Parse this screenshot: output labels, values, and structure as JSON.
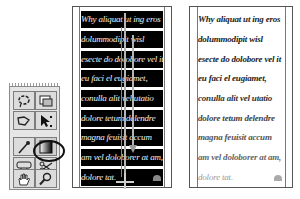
{
  "tool_palette": {
    "tools": [
      {
        "name": "lasso-tool",
        "icon": "lasso-icon",
        "row": 0,
        "col": 0
      },
      {
        "name": "image-frame-tool",
        "icon": "frame-icon",
        "row": 0,
        "col": 1
      },
      {
        "name": "polygon-lasso-tool",
        "icon": "polygon-lasso-icon",
        "row": 1,
        "col": 0
      },
      {
        "name": "direct-select-tool",
        "icon": "direct-select-icon",
        "row": 1,
        "col": 1
      },
      {
        "name": "eyedropper-tool",
        "icon": "eyedropper-icon",
        "row": 2,
        "col": 0
      },
      {
        "name": "gradient-tool",
        "icon": "gradient-icon",
        "row": 2,
        "col": 1,
        "selected": true
      },
      {
        "name": "button-tool",
        "icon": "button-icon",
        "row": 3,
        "col": 0
      },
      {
        "name": "scissors-tool",
        "icon": "scissors-icon",
        "row": 3,
        "col": 1
      },
      {
        "name": "hand-tool",
        "icon": "hand-icon",
        "row": 4,
        "col": 0
      },
      {
        "name": "zoom-tool",
        "icon": "magnifier-icon",
        "row": 4,
        "col": 1
      }
    ],
    "highlighted_tool": "gradient-tool"
  },
  "left_page": {
    "state": "gradient-applied",
    "lines": [
      "Why aliquat ut ing eros",
      "dolummodipit        wisl",
      "esecte do dolobore vel it",
      "eu  faci  el  eugiamet,",
      "conulla  alit  vel  utatio",
      "dolore tetum delendre",
      "magna  feuisit  accum",
      "am vel doloborer at am,",
      "dolore  tat."
    ]
  },
  "right_page": {
    "state": "result",
    "lines": [
      "Why aliquat ut ing eros",
      "dolummodipit        wisl",
      "esecte do dolobore vel it",
      "eu  faci  el  eugiamet,",
      "conulla  alit  vel  utatio",
      "dolore tetum delendre",
      "magna  feuisit  accum",
      "am vel doloborer at am,",
      "dolore  tat."
    ]
  },
  "colors": {
    "text_band": "#000000",
    "page_border": "#555555",
    "palette_bg": "#e6e6e6"
  }
}
